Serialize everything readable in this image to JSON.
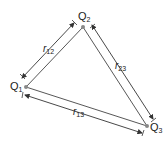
{
  "diagram": {
    "charges": [
      {
        "id": "q1",
        "label": "Q",
        "sub": "1",
        "x": 26,
        "y": 87
      },
      {
        "id": "q2",
        "label": "Q",
        "sub": "2",
        "x": 83,
        "y": 27
      },
      {
        "id": "q3",
        "label": "Q",
        "sub": "3",
        "x": 147,
        "y": 126
      }
    ],
    "distances": [
      {
        "id": "r12",
        "label": "r",
        "sub": "12"
      },
      {
        "id": "r23",
        "label": "r",
        "sub": "23"
      },
      {
        "id": "r13",
        "label": "r",
        "sub": "13"
      }
    ],
    "colors": {
      "line": "#333333",
      "point": "#888888"
    }
  }
}
